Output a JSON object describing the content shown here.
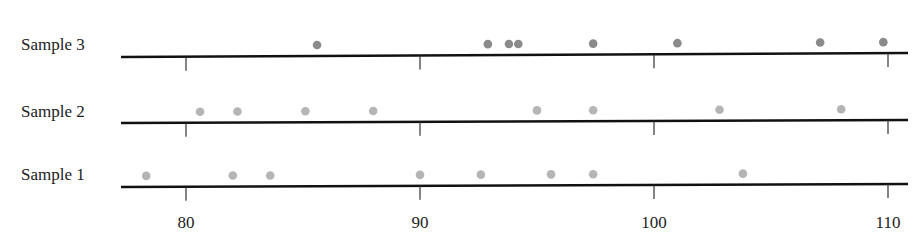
{
  "chart_data": {
    "type": "scatter",
    "subtype": "dot-plot",
    "title": "",
    "xlabel": "",
    "ylabel": "",
    "xlim": [
      77.5,
      111
    ],
    "xticks": [
      80,
      90,
      100,
      110
    ],
    "xtick_labels": [
      "80",
      "90",
      "100",
      "110"
    ],
    "grid": false,
    "legend": null,
    "series": [
      {
        "name": "Sample 3",
        "color": "#8a8a8a",
        "values": [
          85.6,
          92.9,
          93.8,
          94.2,
          97.4,
          101.0,
          107.1,
          109.8
        ]
      },
      {
        "name": "Sample 2",
        "color": "#b5b5b5",
        "values": [
          80.6,
          82.2,
          85.1,
          88.0,
          95.0,
          97.4,
          102.8,
          108.0
        ]
      },
      {
        "name": "Sample 1",
        "color": "#b5b5b5",
        "values": [
          78.3,
          82.0,
          83.6,
          90.0,
          92.6,
          95.6,
          97.4,
          103.8
        ]
      }
    ]
  },
  "layout": {
    "x_px_at_80": 186,
    "px_per_unit": 23.4,
    "line_x_start": 121,
    "line_x_end": 908,
    "rows": [
      {
        "axis_y_left": 57,
        "axis_y_right": 53,
        "label_y": 50
      },
      {
        "axis_y_left": 123,
        "axis_y_right": 120,
        "label_y": 117
      },
      {
        "axis_y_left": 187,
        "axis_y_right": 184,
        "label_y": 180
      }
    ],
    "tick_length": 14,
    "tick_label_y": 228
  }
}
